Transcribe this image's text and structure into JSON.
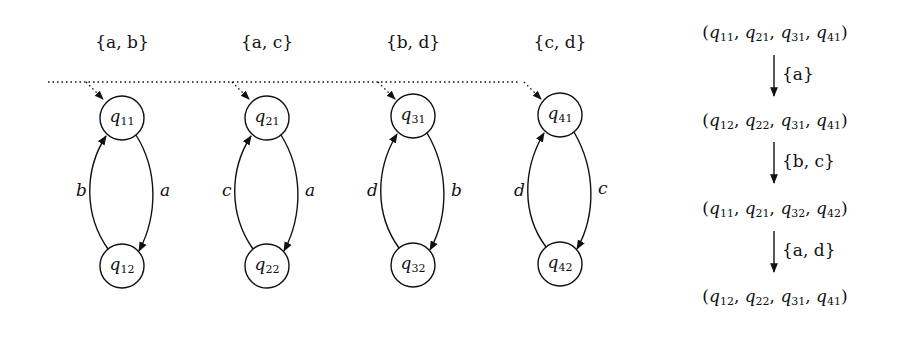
{
  "automata": [
    {
      "alphabet": "{a, b}",
      "alphabet_letters": [
        "a",
        "b"
      ],
      "states": [
        {
          "name": "q",
          "sub": "11",
          "initial": true
        },
        {
          "name": "q",
          "sub": "12",
          "initial": false
        }
      ],
      "edges": [
        {
          "from": "q11",
          "to": "q12",
          "label": "a",
          "side": "right"
        },
        {
          "from": "q12",
          "to": "q11",
          "label": "b",
          "side": "left"
        }
      ]
    },
    {
      "alphabet": "{a, c}",
      "alphabet_letters": [
        "a",
        "c"
      ],
      "states": [
        {
          "name": "q",
          "sub": "21",
          "initial": true
        },
        {
          "name": "q",
          "sub": "22",
          "initial": false
        }
      ],
      "edges": [
        {
          "from": "q21",
          "to": "q22",
          "label": "a",
          "side": "right"
        },
        {
          "from": "q22",
          "to": "q21",
          "label": "c",
          "side": "left"
        }
      ]
    },
    {
      "alphabet": "{b, d}",
      "alphabet_letters": [
        "b",
        "d"
      ],
      "states": [
        {
          "name": "q",
          "sub": "31",
          "initial": true
        },
        {
          "name": "q",
          "sub": "32",
          "initial": false
        }
      ],
      "edges": [
        {
          "from": "q31",
          "to": "q32",
          "label": "b",
          "side": "right"
        },
        {
          "from": "q32",
          "to": "q31",
          "label": "d",
          "side": "left"
        }
      ]
    },
    {
      "alphabet": "{c, d}",
      "alphabet_letters": [
        "c",
        "d"
      ],
      "states": [
        {
          "name": "q",
          "sub": "41",
          "initial": true
        },
        {
          "name": "q",
          "sub": "42",
          "initial": false
        }
      ],
      "edges": [
        {
          "from": "q41",
          "to": "q42",
          "label": "c",
          "side": "right"
        },
        {
          "from": "q42",
          "to": "q41",
          "label": "d",
          "side": "left"
        }
      ]
    }
  ],
  "run": {
    "configurations": [
      [
        "11",
        "21",
        "31",
        "41"
      ],
      [
        "12",
        "22",
        "31",
        "41"
      ],
      [
        "11",
        "21",
        "32",
        "42"
      ],
      [
        "12",
        "22",
        "31",
        "41"
      ]
    ],
    "steps": [
      {
        "letters": [
          "a"
        ],
        "label": "{a}"
      },
      {
        "letters": [
          "b",
          "c"
        ],
        "label": "{b, c}"
      },
      {
        "letters": [
          "a",
          "d"
        ],
        "label": "{a, d}"
      }
    ]
  },
  "colors": {
    "ink": "#111111",
    "background": "#ffffff"
  }
}
